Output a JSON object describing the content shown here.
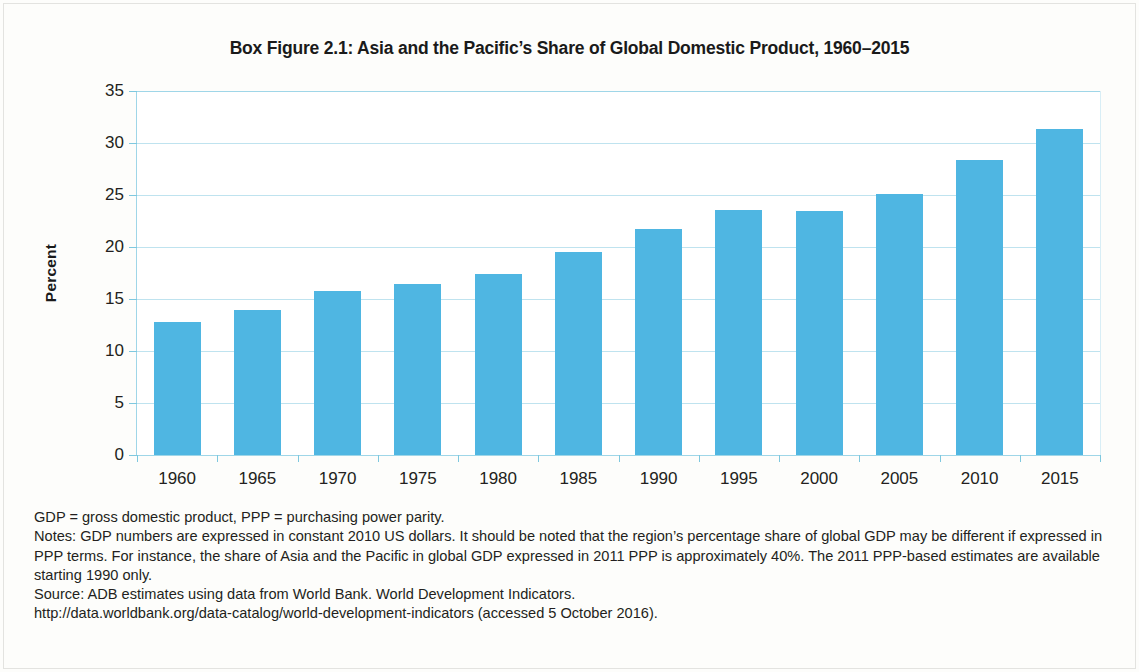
{
  "figure": {
    "title": "Box Figure 2.1:  Asia and the Pacific’s Share of Global Domestic Product, 1960–2015",
    "y_axis_title": "Percent"
  },
  "chart_data": {
    "type": "bar",
    "title": "Box Figure 2.1:  Asia and the Pacific’s Share of Global Domestic Product, 1960–2015",
    "xlabel": "",
    "ylabel": "Percent",
    "categories": [
      "1960",
      "1965",
      "1970",
      "1975",
      "1980",
      "1985",
      "1990",
      "1995",
      "2000",
      "2005",
      "2010",
      "2015"
    ],
    "values": [
      12.8,
      13.9,
      15.8,
      16.4,
      17.4,
      19.5,
      21.7,
      23.6,
      23.5,
      25.1,
      28.4,
      31.3
    ],
    "ylim": [
      0,
      35
    ],
    "yticks": [
      0,
      5,
      10,
      15,
      20,
      25,
      30,
      35
    ],
    "ytick_labels": [
      "0",
      "5",
      "10",
      "15",
      "20",
      "25",
      "30",
      "35"
    ],
    "grid": true,
    "legend": "none",
    "series_color": "#4fb6e2",
    "grid_color": "#bfe3ef"
  },
  "notes": {
    "line1": "GDP = gross domestic product, PPP = purchasing power parity.",
    "line2": "Notes: GDP numbers are expressed in constant 2010 US dollars. It should be noted that the region’s percentage share of global GDP may be different if expressed in PPP terms. For instance, the share of Asia and the Pacific in global GDP expressed in 2011 PPP is approximately 40%. The 2011 PPP-based estimates are available starting 1990 only.",
    "line3": "Source:  ADB estimates using data from World Bank. World Development Indicators.",
    "line4": "http://data.worldbank.org/data-catalog/world-development-indicators (accessed 5 October 2016)."
  }
}
